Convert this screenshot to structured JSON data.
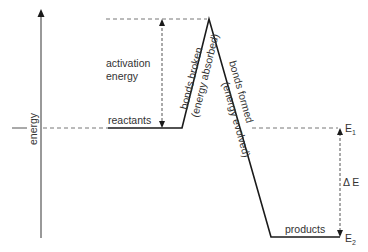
{
  "diagram": {
    "colors": {
      "line": "#1a1a1a",
      "dashed": "#777777",
      "text": "#333333",
      "background": "#ffffff"
    },
    "axis": {
      "y_label": "energy"
    },
    "labels": {
      "activation_line1": "activation",
      "activation_line2": "energy",
      "reactants": "reactants",
      "products": "products",
      "bonds_broken": "bonds broken",
      "energy_absorbed": "(energy absorbed)",
      "bonds_formed": "bonds formed",
      "energy_evolved": "(energy evolved)",
      "e1_main": "E",
      "e1_sub": "1",
      "e2_main": "E",
      "e2_sub": "2",
      "delta_e": "Δ E"
    }
  }
}
